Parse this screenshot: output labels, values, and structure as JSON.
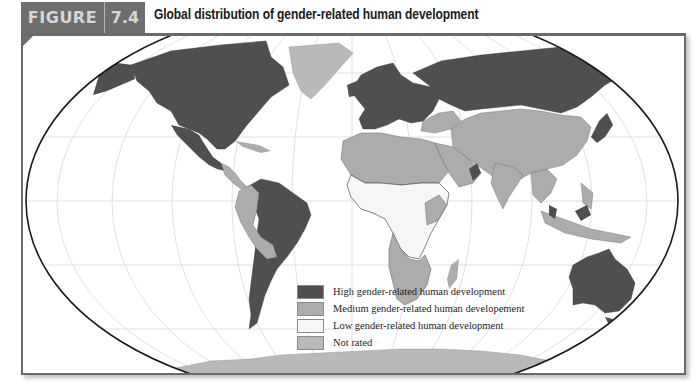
{
  "figure": {
    "label": "FIGURE",
    "number": "7.4",
    "title": "Global distribution of gender-related human development"
  },
  "map": {
    "projection": "elliptical world map (Robinson-like)",
    "colors": {
      "high": "#4f4f4f",
      "medium": "#acacac",
      "low": "#f6f6f6",
      "not_rated": "#b9b9b9",
      "ocean": "#ffffff",
      "outline": "#1a1a1a",
      "graticule": "#d8d8d8",
      "frame": "#6a6a6a",
      "header": "#6e6e6e"
    },
    "regions": [
      {
        "name": "North America (USA, Canada)",
        "category": "High"
      },
      {
        "name": "Mexico",
        "category": "High"
      },
      {
        "name": "Central America",
        "category": "Medium"
      },
      {
        "name": "Greenland",
        "category": "Not rated"
      },
      {
        "name": "Venezuela, Brazil, Chile, Argentina, Uruguay",
        "category": "High"
      },
      {
        "name": "Colombia, Peru, Bolivia, Paraguay, Ecuador",
        "category": "Medium"
      },
      {
        "name": "Western & Central Europe",
        "category": "High"
      },
      {
        "name": "Russia",
        "category": "High"
      },
      {
        "name": "Ukraine, Turkey",
        "category": "Medium"
      },
      {
        "name": "North Africa & Middle East",
        "category": "Medium"
      },
      {
        "name": "Oman, UAE",
        "category": "High"
      },
      {
        "name": "West & Central Africa",
        "category": "Low"
      },
      {
        "name": "Southern Africa",
        "category": "Medium"
      },
      {
        "name": "China, Mongolia, Central Asia",
        "category": "Medium"
      },
      {
        "name": "South Asia (India)",
        "category": "Medium"
      },
      {
        "name": "Japan, South Korea",
        "category": "High"
      },
      {
        "name": "Southeast Asia",
        "category": "Medium"
      },
      {
        "name": "Malaysia",
        "category": "High"
      },
      {
        "name": "Australia, New Zealand",
        "category": "High"
      },
      {
        "name": "Antarctica",
        "category": "Not rated"
      }
    ]
  },
  "legend": {
    "items": [
      {
        "label": "High gender-related human development",
        "color": "#4f4f4f"
      },
      {
        "label": "Medium gender-related human developement",
        "color": "#acacac"
      },
      {
        "label": "Low gender-related human development",
        "color": "#f6f6f6"
      },
      {
        "label": "Not rated",
        "color": "#b9b9b9"
      }
    ]
  }
}
